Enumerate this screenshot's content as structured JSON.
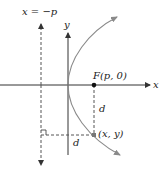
{
  "diagram": {
    "type": "parabola-focus-directrix",
    "labels": {
      "directrix": "x = −p",
      "y_axis": "y",
      "x_axis": "x",
      "focus": "F(p, 0)",
      "point": "(x, y)",
      "distance_to_focus": "d",
      "distance_to_directrix": "d"
    },
    "colors": {
      "axes": "#333333",
      "parabola": "#8a8a8a",
      "dashed": "#555555",
      "points": "#111111",
      "background": "#ffffff"
    }
  }
}
